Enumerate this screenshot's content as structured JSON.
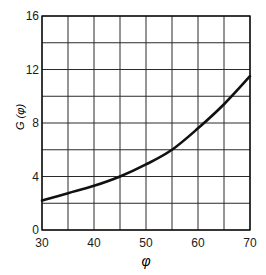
{
  "chart_data": {
    "type": "line",
    "title": "",
    "xlabel": "φ",
    "ylabel": "G (φ)",
    "xlim": [
      30,
      70
    ],
    "ylim": [
      0,
      16
    ],
    "grid": true,
    "legend": null,
    "x_ticks": [
      30,
      40,
      50,
      60,
      70
    ],
    "x_tick_labels": [
      "30",
      "40",
      "50",
      "60",
      "70"
    ],
    "x_gridlines": [
      30,
      35,
      40,
      45,
      50,
      55,
      60,
      65,
      70
    ],
    "y_ticks": [
      0,
      4,
      8,
      12,
      16
    ],
    "y_tick_labels": [
      "0",
      "4",
      "8",
      "12",
      "16"
    ],
    "y_gridlines": [
      0,
      2,
      4,
      6,
      8,
      10,
      12,
      14,
      16
    ],
    "series": [
      {
        "name": "G(φ)",
        "x": [
          30,
          35,
          40,
          45,
          50,
          55,
          60,
          65,
          70
        ],
        "y": [
          2.2,
          2.75,
          3.3,
          4.0,
          4.9,
          6.0,
          7.6,
          9.4,
          11.5
        ]
      }
    ]
  },
  "style": {
    "line_color": "#111111",
    "grid_color": "#2a2a2a",
    "text_color": "#1a1a1a",
    "background": "#ffffff"
  }
}
